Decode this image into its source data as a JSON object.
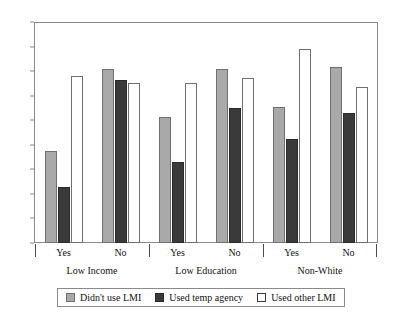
{
  "chart_data": {
    "type": "bar",
    "title": "",
    "subtitle": "",
    "xlabel": "",
    "ylabel": "",
    "ylim": [
      0,
      90
    ],
    "yticks": [
      0,
      10,
      20,
      30,
      40,
      50,
      60,
      70,
      80,
      90
    ],
    "grid": false,
    "legend_position": "bottom",
    "group_labels": [
      "Low Income",
      "Low Education",
      "Non-White"
    ],
    "categories": [
      "Yes",
      "No",
      "Yes",
      "No",
      "Yes",
      "No"
    ],
    "category_groups": [
      {
        "group": "Low Income",
        "categories": [
          "Yes",
          "No"
        ]
      },
      {
        "group": "Low Education",
        "categories": [
          "Yes",
          "No"
        ]
      },
      {
        "group": "Non-White",
        "categories": [
          "Yes",
          "No"
        ]
      }
    ],
    "series": [
      {
        "name": "Didn't use LMI",
        "color": "#a9a9a9",
        "values": [
          37.5,
          71.0,
          51.5,
          71.0,
          55.5,
          71.5
        ]
      },
      {
        "name": "Used temp agency",
        "color": "#3a3a3a",
        "values": [
          23.0,
          66.5,
          33.0,
          55.0,
          42.5,
          53.0
        ]
      },
      {
        "name": "Used other LMI",
        "color": "#ffffff",
        "values": [
          68.0,
          65.0,
          65.0,
          67.0,
          79.0,
          63.5
        ]
      }
    ]
  },
  "legend": {
    "items": [
      {
        "label": "Didn't use LMI",
        "swatch": "legend-swatch-gray"
      },
      {
        "label": "Used temp agency",
        "swatch": "legend-swatch-black"
      },
      {
        "label": "Used other LMI",
        "swatch": "legend-swatch-white"
      }
    ]
  },
  "axis": {
    "y_tick_labels": [
      "90",
      "80",
      "70",
      "60",
      "50",
      "40",
      "30",
      "20",
      "10",
      "0"
    ]
  }
}
